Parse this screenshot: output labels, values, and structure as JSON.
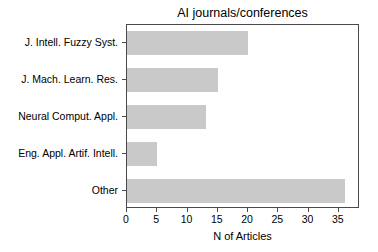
{
  "chart_data": {
    "type": "bar",
    "orientation": "horizontal",
    "title": "AI journals/conferences",
    "xlabel": "N of Articles",
    "ylabel": "",
    "categories": [
      "J. Intell. Fuzzy Syst.",
      "J. Mach. Learn. Res.",
      "Neural Comput. Appl.",
      "Eng. Appl. Artif. Intell.",
      "Other"
    ],
    "values": [
      20,
      15,
      13,
      5,
      36
    ],
    "xticks": [
      0,
      5,
      10,
      15,
      20,
      25,
      30,
      35
    ],
    "xtick_labels": [
      "0",
      "5",
      "10",
      "15",
      "20",
      "25",
      "30",
      "35"
    ],
    "xlim": [
      0,
      38.5
    ],
    "grid": false,
    "legend": null,
    "bar_color": "#c9c9c9",
    "axis_color": "#4a4a4a",
    "background_color": "#ffffff"
  }
}
